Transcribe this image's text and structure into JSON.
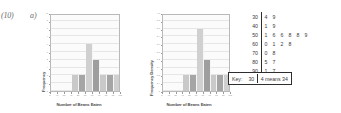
{
  "question": {
    "number": "(10)",
    "part_a_label": "a)",
    "part_b_label": "b)"
  },
  "chart_data": [
    {
      "id": "frequency-histogram",
      "type": "bar",
      "title": "",
      "xlabel": "Number of Beans Eaten",
      "ylabel": "Frequency",
      "xlim": [
        0,
        100
      ],
      "ylim": [
        0,
        10
      ],
      "xticks": [
        "0",
        "10",
        "20",
        "30",
        "40",
        "50",
        "60",
        "70",
        "80",
        "90",
        "100"
      ],
      "yticks": [
        "0",
        "1",
        "2",
        "3",
        "4",
        "5",
        "6",
        "7",
        "8",
        "9",
        "10"
      ],
      "grid": true,
      "legend": "none",
      "bin_edges": [
        30,
        40,
        50,
        60,
        70,
        80,
        90,
        100
      ],
      "categories": [
        "30-40",
        "40-50",
        "50-60",
        "60-70",
        "70-80",
        "80-90",
        "90-100"
      ],
      "values": [
        2,
        2,
        6,
        4,
        2,
        2,
        2
      ],
      "bar_colors": [
        "#c9c9c9",
        "#a5a5a5",
        "#d0d0d0",
        "#9e9e9e",
        "#c9c9c9",
        "#a5a5a5",
        "#cfcfcf"
      ]
    },
    {
      "id": "frequency-density-histogram",
      "type": "bar",
      "title": "",
      "xlabel": "Number of Beans Eaten",
      "ylabel": "Frequency Density",
      "xlim": [
        0,
        100
      ],
      "ylim": [
        0,
        1.0
      ],
      "xticks": [
        "0",
        "10",
        "20",
        "30",
        "40",
        "50",
        "60",
        "70",
        "80",
        "90",
        "100"
      ],
      "yticks": [
        "0",
        "0.1",
        "0.2",
        "0.3",
        "0.4",
        "0.5",
        "0.6",
        "0.7",
        "0.8",
        "0.9",
        "1.0"
      ],
      "grid": true,
      "legend": "none",
      "bin_edges": [
        30,
        40,
        50,
        60,
        70,
        80,
        90,
        100
      ],
      "categories": [
        "30-40",
        "40-50",
        "50-60",
        "60-70",
        "70-80",
        "80-90",
        "90-100"
      ],
      "values": [
        0.2,
        0.2,
        0.8,
        0.4,
        0.2,
        0.2,
        0.2
      ],
      "bar_colors": [
        "#c9c9c9",
        "#a5a5a5",
        "#d0d0d0",
        "#9e9e9e",
        "#c9c9c9",
        "#a5a5a5",
        "#cfcfcf"
      ]
    }
  ],
  "stem_leaf": {
    "rows": [
      {
        "stem": "30",
        "leaves": [
          "4",
          "9"
        ]
      },
      {
        "stem": "40",
        "leaves": [
          "1",
          "9"
        ]
      },
      {
        "stem": "50",
        "leaves": [
          "1",
          "6",
          "6",
          "8",
          "8",
          "9"
        ]
      },
      {
        "stem": "60",
        "leaves": [
          "0",
          "1",
          "2",
          "8"
        ]
      },
      {
        "stem": "70",
        "leaves": [
          "0",
          "8"
        ]
      },
      {
        "stem": "80",
        "leaves": [
          "5",
          "7"
        ]
      },
      {
        "stem": "90",
        "leaves": [
          "1",
          "7"
        ]
      }
    ],
    "key": {
      "label": "Key:",
      "stem": "30",
      "means": "4 means 34"
    }
  }
}
